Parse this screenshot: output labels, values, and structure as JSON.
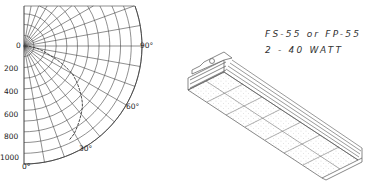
{
  "figure": {
    "caption_line1": "FS-55 or FP-55",
    "caption_line2": "2 - 40 WATT"
  },
  "chart_data": {
    "type": "polar",
    "radial_axis": {
      "ticks": [
        "0",
        "200",
        "400",
        "600",
        "800",
        "1000"
      ],
      "range": [
        0,
        1000
      ]
    },
    "angular_axis": {
      "labels": [
        "0°",
        "30°",
        "60°",
        "90°"
      ],
      "range_deg": [
        0,
        90
      ]
    },
    "series": [
      {
        "name": "candlepower",
        "angles_deg": [
          0,
          15,
          30,
          45,
          60,
          70,
          80,
          90
        ],
        "values": [
          1050,
          1010,
          900,
          740,
          500,
          250,
          110,
          0
        ]
      }
    ],
    "grid": true
  },
  "labels": {
    "r0": "0",
    "r200": "200",
    "r400": "400",
    "r600": "600",
    "r800": "800",
    "r1000": "1000",
    "a90": "90°",
    "a60": "60°",
    "a30": "30°",
    "a0": "0°"
  }
}
